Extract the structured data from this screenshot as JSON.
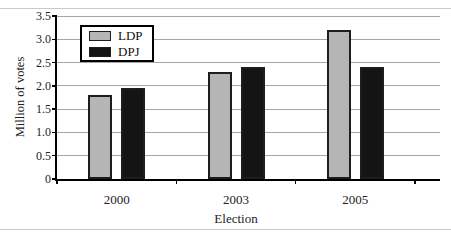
{
  "figure": {
    "top_rule_color": "#c9c9c9",
    "bottom_rule_color": "#c9c9c9",
    "background": "#ffffff"
  },
  "chart_data": {
    "type": "bar",
    "title": "",
    "categories": [
      "2000",
      "2003",
      "2005"
    ],
    "series": [
      {
        "name": "LDP",
        "color": "#b5b5b5",
        "values": [
          1.8,
          2.3,
          3.2
        ]
      },
      {
        "name": "DPJ",
        "color": "#141414",
        "values": [
          1.95,
          2.4,
          2.4
        ]
      }
    ],
    "xlabel": "Election",
    "ylabel": "Million of votes",
    "ylim": [
      0,
      3.5
    ],
    "ytick_step": 0.5,
    "ytick_labels": [
      "0",
      "0.5",
      "1.0",
      "1.5",
      "2.0",
      "2.5",
      "3.0",
      "3.5"
    ],
    "grid": true,
    "gridline_color": "#a6a6a6",
    "axis_color": "#000000",
    "bar_border_color": "#1d1d1d",
    "legend_position": "top-left-inside",
    "legend_border_color": "#000000"
  }
}
